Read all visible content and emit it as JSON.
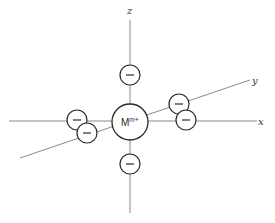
{
  "diagram": {
    "axes": {
      "x": {
        "label": "x",
        "color": "#8a8a8a"
      },
      "y": {
        "label": "y",
        "color": "#8a8a8a"
      },
      "z": {
        "label": "z",
        "color": "#8a8a8a"
      }
    },
    "metal_ion": {
      "symbol": "M",
      "charge": "m+"
    },
    "ligands": [
      {
        "position": "+z",
        "charge_symbol": "−"
      },
      {
        "position": "-z",
        "charge_symbol": "−"
      },
      {
        "position": "+x",
        "charge_symbol": "−"
      },
      {
        "position": "-x",
        "charge_symbol": "−"
      },
      {
        "position": "+y",
        "charge_symbol": "−"
      },
      {
        "position": "-y",
        "charge_symbol": "−"
      }
    ],
    "colors": {
      "stroke": "#2a2a2a",
      "axis": "#8a8a8a",
      "background": "#ffffff"
    }
  }
}
